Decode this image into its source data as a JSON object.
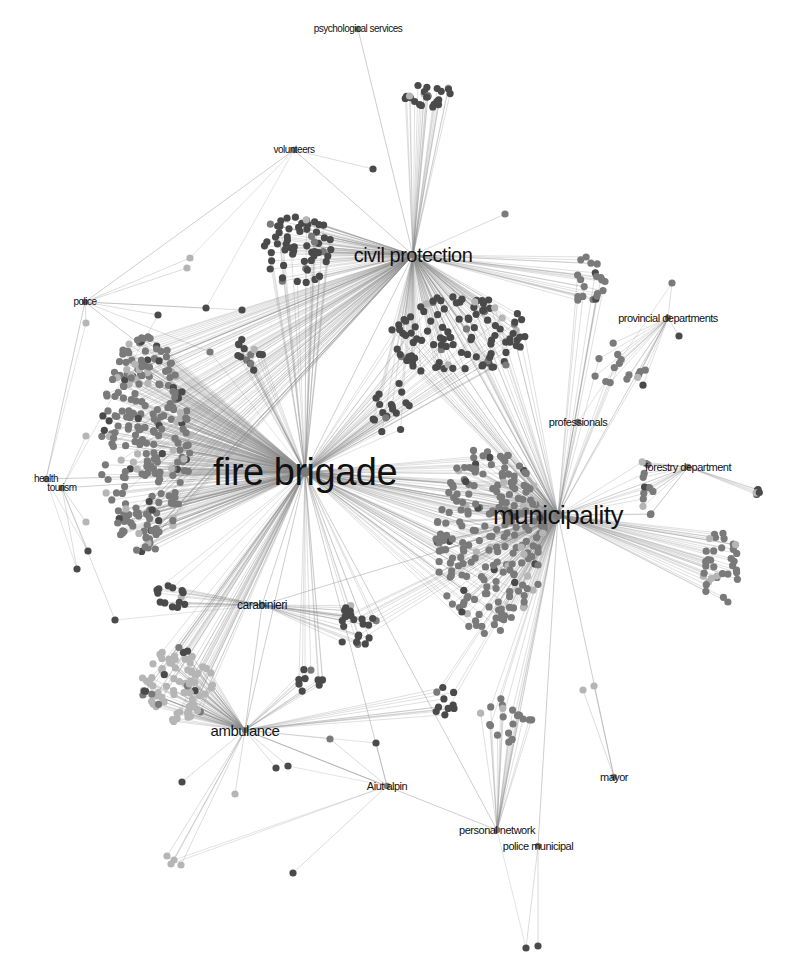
{
  "diagram": {
    "type": "network-graph",
    "colors": {
      "edge": "#8a8a8a",
      "node_dark": "#4a4a4a",
      "node_mid": "#7a7a7a",
      "node_light": "#b5b5b5",
      "label": "#111111",
      "background": "#ffffff"
    },
    "hubs": [
      {
        "id": "fire_brigade",
        "label": "fire brigade",
        "x": 305,
        "y": 472,
        "size": 38
      },
      {
        "id": "municipality",
        "label": "municipality",
        "x": 558,
        "y": 515,
        "size": 26
      },
      {
        "id": "civil_protection",
        "label": "civil protection",
        "x": 413,
        "y": 255,
        "size": 20
      },
      {
        "id": "ambulance",
        "label": "ambulance",
        "x": 245,
        "y": 730,
        "size": 15
      },
      {
        "id": "carabinieri",
        "label": "carabinieri",
        "x": 262,
        "y": 605,
        "size": 12
      },
      {
        "id": "professionals",
        "label": "professionals",
        "x": 578,
        "y": 422,
        "size": 11
      },
      {
        "id": "forestry_department",
        "label": "forestry department",
        "x": 688,
        "y": 467,
        "size": 11
      },
      {
        "id": "provincial_departments",
        "label": "provincial departments",
        "x": 668,
        "y": 318,
        "size": 11
      },
      {
        "id": "police",
        "label": "police",
        "x": 85,
        "y": 302,
        "size": 10
      },
      {
        "id": "volunteers",
        "label": "volunteers",
        "x": 294,
        "y": 150,
        "size": 10
      },
      {
        "id": "psychological_services",
        "label": "psychological services",
        "x": 358,
        "y": 29,
        "size": 10
      },
      {
        "id": "health",
        "label": "health",
        "x": 46,
        "y": 479,
        "size": 10
      },
      {
        "id": "tourism",
        "label": "tourism",
        "x": 62,
        "y": 488,
        "size": 10
      },
      {
        "id": "aiut_alpin",
        "label": "Aiut alpin",
        "x": 387,
        "y": 786,
        "size": 11
      },
      {
        "id": "personal_network",
        "label": "personal network",
        "x": 497,
        "y": 830,
        "size": 11
      },
      {
        "id": "police_municipal",
        "label": "police municipal",
        "x": 538,
        "y": 846,
        "size": 11
      },
      {
        "id": "mayor",
        "label": "mayor",
        "x": 614,
        "y": 777,
        "size": 11
      }
    ]
  }
}
